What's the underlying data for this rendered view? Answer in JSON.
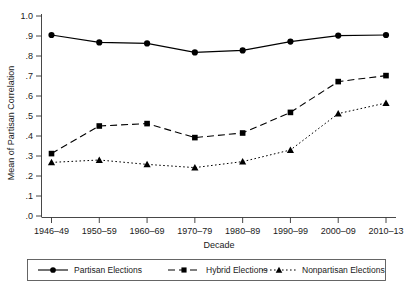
{
  "chart_data": {
    "type": "line",
    "title": "",
    "xlabel": "Decade",
    "ylabel": "Mean of Partisan Correlation",
    "categories": [
      "1946–49",
      "1950–59",
      "1960–69",
      "1970–79",
      "1980–89",
      "1990–99",
      "2000–09",
      "2010–13"
    ],
    "ylim": [
      0,
      1.0
    ],
    "ytick_labels": [
      "1.0",
      ".9",
      ".8",
      ".7",
      ".6",
      ".5",
      ".4",
      ".3",
      ".2",
      ".1",
      ".0"
    ],
    "ytick_values": [
      1.0,
      0.9,
      0.8,
      0.7,
      0.6,
      0.5,
      0.4,
      0.3,
      0.2,
      0.1,
      0.0
    ],
    "grid": false,
    "legend_position": "bottom",
    "series": [
      {
        "name": "Partisan Elections",
        "marker": "circle",
        "linestyle": "solid",
        "values": [
          0.905,
          0.868,
          0.863,
          0.818,
          0.828,
          0.872,
          0.902,
          0.905
        ]
      },
      {
        "name": "Hybrid Elections",
        "marker": "square",
        "linestyle": "dashed",
        "values": [
          0.312,
          0.45,
          0.462,
          0.392,
          0.415,
          0.518,
          0.672,
          0.702
        ]
      },
      {
        "name": "Nonpartisan Elections",
        "marker": "triangle",
        "linestyle": "dotted",
        "values": [
          0.268,
          0.28,
          0.258,
          0.242,
          0.272,
          0.33,
          0.512,
          0.565
        ]
      }
    ]
  },
  "legend": {
    "items": [
      {
        "label": "Partisan Elections"
      },
      {
        "label": "Hybrid Elections"
      },
      {
        "label": "Nonpartisan Elections"
      }
    ]
  },
  "colors": {
    "ink": "#000000",
    "axis": "#333333",
    "background": "#ffffff"
  }
}
